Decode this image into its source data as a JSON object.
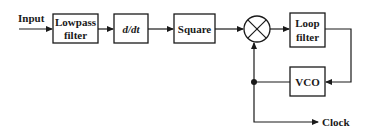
{
  "diagram": {
    "type": "block-diagram",
    "input_label": "Input",
    "output_label": "Clock",
    "blocks": [
      {
        "id": "lowpass",
        "line1": "Lowpass",
        "line2": "filter"
      },
      {
        "id": "ddt",
        "label": "d/dt"
      },
      {
        "id": "square",
        "label": "Square"
      },
      {
        "id": "multiplier",
        "symbol": "⊗"
      },
      {
        "id": "loopfilter",
        "line1": "Loop",
        "line2": "filter"
      },
      {
        "id": "vco",
        "label": "VCO"
      }
    ],
    "connections": [
      [
        "Input",
        "lowpass"
      ],
      [
        "lowpass",
        "ddt"
      ],
      [
        "ddt",
        "square"
      ],
      [
        "square",
        "multiplier"
      ],
      [
        "multiplier",
        "loopfilter"
      ],
      [
        "loopfilter",
        "vco"
      ],
      [
        "vco",
        "multiplier"
      ],
      [
        "vco",
        "Clock"
      ]
    ]
  }
}
